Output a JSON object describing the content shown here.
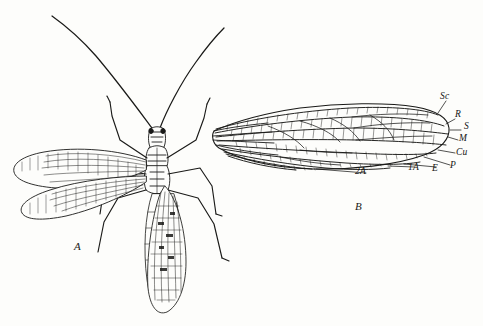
{
  "plate": {
    "title": "Entomological plate: insect habitus and forewing venation",
    "background_color": "#fdfdfb",
    "ink_color": "#1a1a18",
    "figures": [
      {
        "id": "A",
        "label": "A",
        "caption": "Whole insect, dorsal view with spread left wings",
        "label_x": 74,
        "label_y": 246
      },
      {
        "id": "B",
        "label": "B",
        "caption": "Isolated forewing showing venation",
        "label_x": 355,
        "label_y": 206
      }
    ],
    "vein_labels": [
      {
        "text": "Sc",
        "x": 440,
        "y": 98,
        "name": "subcosta"
      },
      {
        "text": "R",
        "x": 457,
        "y": 116,
        "name": "radius"
      },
      {
        "text": "S",
        "x": 466,
        "y": 127,
        "name": "radial-sector"
      },
      {
        "text": "M",
        "x": 461,
        "y": 140,
        "name": "media"
      },
      {
        "text": "Cu",
        "x": 458,
        "y": 154,
        "name": "cubitus"
      },
      {
        "text": "P",
        "x": 452,
        "y": 167,
        "name": "plical"
      },
      {
        "text": "E",
        "x": 434,
        "y": 170,
        "name": "empusal"
      },
      {
        "text": "1A",
        "x": 411,
        "y": 169,
        "name": "first-anal"
      },
      {
        "text": "2A",
        "x": 358,
        "y": 173,
        "name": "second-anal"
      }
    ]
  }
}
